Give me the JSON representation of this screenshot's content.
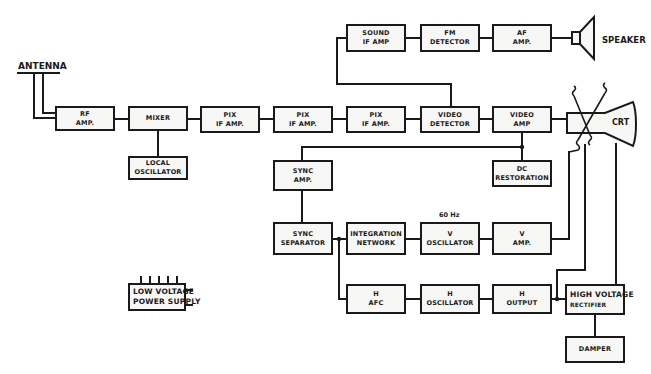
{
  "diagram": {
    "labels": {
      "antenna": "ANTENNA",
      "speaker": "SPEAKER",
      "crt": "CRT",
      "freq_60hz": "60 Hz"
    },
    "blocks": {
      "rf_amp": [
        "RF",
        "AMP."
      ],
      "mixer": [
        "MIXER"
      ],
      "local_oscillator": [
        "LOCAL",
        "OSCILLATOR"
      ],
      "pix_if_1": [
        "PIX",
        "IF AMP."
      ],
      "pix_if_2": [
        "PIX",
        "IF AMP."
      ],
      "pix_if_3": [
        "PIX",
        "IF AMP."
      ],
      "video_detector": [
        "VIDEO",
        "DETECTOR"
      ],
      "video_amp": [
        "VIDEO",
        "AMP"
      ],
      "dc_restoration": [
        "DC",
        "RESTORATION"
      ],
      "sound_if_amp": [
        "SOUND",
        "IF  AMP"
      ],
      "fm_detector": [
        "FM",
        "DETECTOR"
      ],
      "af_amp": [
        "AF",
        "AMP."
      ],
      "sync_amp": [
        "SYNC",
        "AMP."
      ],
      "sync_separator": [
        "SYNC",
        "SEPARATOR"
      ],
      "integration_network": [
        "INTEGRATION",
        "NETWORK"
      ],
      "v_oscillator": [
        "V",
        "OSCILLATOR"
      ],
      "v_amp": [
        "V",
        "AMP."
      ],
      "h_afc": [
        "H",
        "AFC"
      ],
      "h_oscillator": [
        "H",
        "OSCILLATOR"
      ],
      "h_output": [
        "H",
        "OUTPUT"
      ],
      "high_voltage_rectifier": [
        "HIGH VOLTAGE",
        "RECTIFIER"
      ],
      "damper": [
        "DAMPER"
      ],
      "low_voltage_power_supply": [
        "LOW VOLTAGE",
        "POWER SUPPLY"
      ]
    },
    "colors": {
      "line": "#1a1a1a",
      "box_fill": "#f7f7f5",
      "background": "#ffffff"
    }
  }
}
